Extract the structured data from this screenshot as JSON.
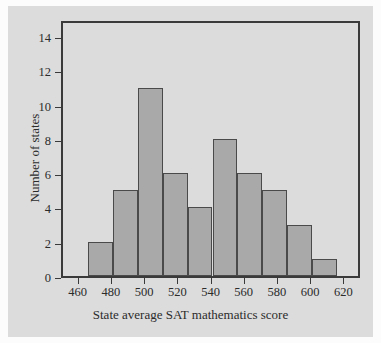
{
  "chart_data": {
    "type": "bar",
    "title": "",
    "subtitle": "",
    "xlabel": "State average SAT mathematics score",
    "ylabel": "Number of states",
    "grid": false,
    "legend": false,
    "xlim": [
      450,
      630
    ],
    "ylim": [
      0,
      15
    ],
    "bin_width": 15,
    "categories": [
      "465-480",
      "480-495",
      "495-510",
      "510-525",
      "525-540",
      "540-555",
      "555-570",
      "570-585",
      "585-600",
      "600-615"
    ],
    "bin_edges": [
      465,
      480,
      495,
      510,
      525,
      540,
      555,
      570,
      585,
      600,
      615
    ],
    "values": [
      2,
      5,
      11,
      6,
      4,
      8,
      6,
      5,
      3,
      1
    ],
    "xticks": [
      460,
      480,
      500,
      520,
      540,
      560,
      580,
      600,
      620
    ],
    "xtick_labels": [
      "460",
      "480",
      "500",
      "520",
      "540",
      "560",
      "580",
      "600",
      "620"
    ],
    "yticks": [
      0,
      2,
      4,
      6,
      8,
      10,
      12,
      14
    ],
    "ytick_labels": [
      "0",
      "2",
      "4",
      "6",
      "8",
      "10",
      "12",
      "14"
    ],
    "colors": {
      "bar_fill": "#a9a9a9",
      "bar_edge": "#4a4a4a",
      "frame": "#3a3a3a",
      "panel_bg": "#dcdcdc",
      "figure_bg": "#fcfcfc",
      "text": "#2b2b2b"
    }
  }
}
